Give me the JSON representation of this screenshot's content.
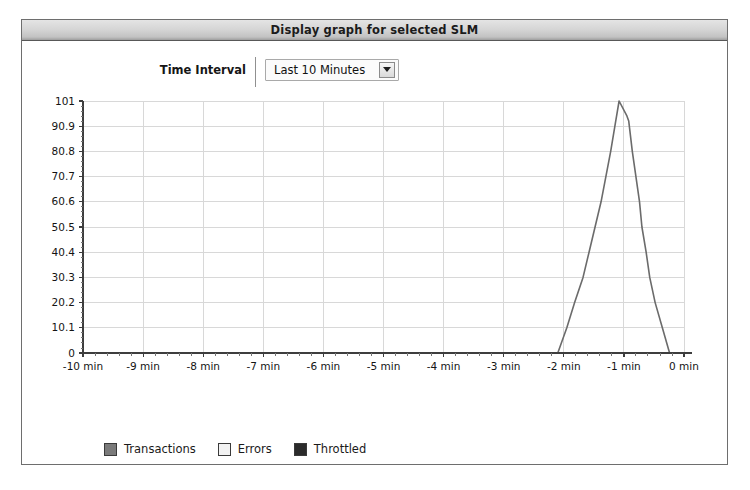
{
  "panel": {
    "title": "Display graph for selected SLM"
  },
  "controls": {
    "time_interval_label": "Time Interval",
    "time_interval_value": "Last 10 Minutes",
    "time_interval_options": [
      "Last 10 Minutes"
    ],
    "dropdown_arrow_icon": "chevron-down-icon"
  },
  "legend": {
    "items": [
      {
        "label": "Transactions",
        "color": "#7a7a7a"
      },
      {
        "label": "Errors",
        "color": "#f2f2f2"
      },
      {
        "label": "Throttled",
        "color": "#2b2b2b"
      }
    ]
  },
  "colors": {
    "panel_border": "#6e6e6e",
    "title_text": "#1b1b1b",
    "axis": "#3d3d3d",
    "grid": "#d8d8d8",
    "series_line": "#6b6b6b",
    "plot_background": "#ffffff"
  },
  "chart_data": {
    "type": "line",
    "title": "",
    "xlabel": "",
    "ylabel": "",
    "grid": true,
    "legend_position": "bottom-left",
    "xlim": [
      -10,
      0
    ],
    "ylim": [
      0,
      101
    ],
    "x_tick_labels": [
      "-10 min",
      "-9 min",
      "-8 min",
      "-7 min",
      "-6 min",
      "-5 min",
      "-4 min",
      "-3 min",
      "-2 min",
      "-1 min",
      "0 min"
    ],
    "x_ticks": [
      -10,
      -9,
      -8,
      -7,
      -6,
      -5,
      -4,
      -3,
      -2,
      -1,
      0
    ],
    "y_tick_labels": [
      "0",
      "10.1",
      "20.2",
      "30.3",
      "40.4",
      "50.5",
      "60.6",
      "70.7",
      "80.8",
      "90.9",
      "101"
    ],
    "y_ticks": [
      0,
      10.1,
      20.2,
      30.3,
      40.4,
      50.5,
      60.6,
      70.7,
      80.8,
      90.9,
      101
    ],
    "series": [
      {
        "name": "Transactions",
        "color": "#6b6b6b",
        "points": [
          {
            "x": -10.0,
            "y": 0
          },
          {
            "x": -2.1,
            "y": 0
          },
          {
            "x": -1.95,
            "y": 10.1
          },
          {
            "x": -1.82,
            "y": 20.2
          },
          {
            "x": -1.68,
            "y": 30.3
          },
          {
            "x": -1.58,
            "y": 40.4
          },
          {
            "x": -1.48,
            "y": 50.5
          },
          {
            "x": -1.38,
            "y": 60.6
          },
          {
            "x": -1.3,
            "y": 70.7
          },
          {
            "x": -1.22,
            "y": 80.8
          },
          {
            "x": -1.15,
            "y": 90.9
          },
          {
            "x": -1.08,
            "y": 101
          },
          {
            "x": -0.95,
            "y": 95.0
          },
          {
            "x": -0.92,
            "y": 93.0
          },
          {
            "x": -0.86,
            "y": 80.8
          },
          {
            "x": -0.8,
            "y": 70.7
          },
          {
            "x": -0.74,
            "y": 60.6
          },
          {
            "x": -0.7,
            "y": 50.5
          },
          {
            "x": -0.63,
            "y": 40.4
          },
          {
            "x": -0.57,
            "y": 30.3
          },
          {
            "x": -0.48,
            "y": 20.2
          },
          {
            "x": -0.36,
            "y": 10.1
          },
          {
            "x": -0.24,
            "y": 0
          },
          {
            "x": 0.0,
            "y": 0
          }
        ]
      },
      {
        "name": "Errors",
        "color": "#f2f2f2",
        "points": []
      },
      {
        "name": "Throttled",
        "color": "#2b2b2b",
        "points": []
      }
    ]
  }
}
